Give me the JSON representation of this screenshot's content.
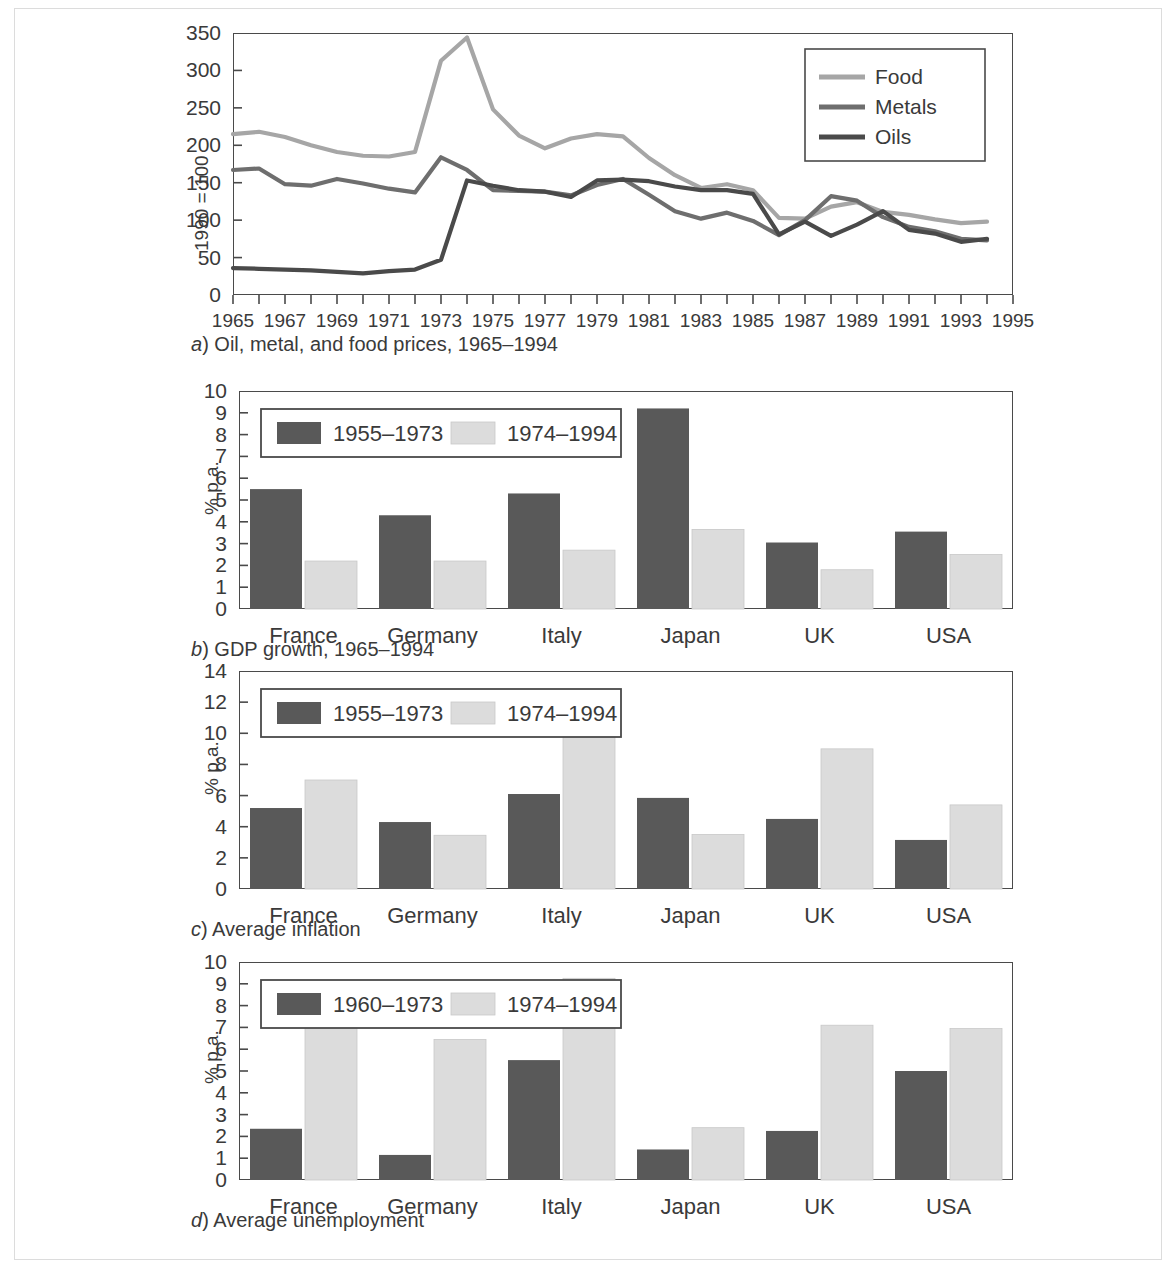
{
  "figure": {
    "panels": [
      {
        "id": "a",
        "caption_letter": "a",
        "caption_text": ") Oil, metal, and food prices, 1965–1994"
      },
      {
        "id": "b",
        "caption_letter": "b",
        "caption_text": ") GDP growth, 1965–1994"
      },
      {
        "id": "c",
        "caption_letter": "c",
        "caption_text": ") Average inflation"
      },
      {
        "id": "d",
        "caption_letter": "d",
        "caption_text": ") Average unemployment"
      }
    ]
  },
  "colors": {
    "food": "#a6a6a6",
    "metals": "#6e6e6e",
    "oils": "#4a4a4a",
    "bar_dark": "#595959",
    "bar_light": "#dcdcdc",
    "axis": "#4a4a4a",
    "text": "#3a3a3a",
    "frame": "#dcdcdc"
  },
  "chart_data": [
    {
      "type": "line",
      "panel": "a",
      "title": "(a) Oil, metal, and food prices, 1965–1994",
      "xlabel": "",
      "ylabel": "1990 = 100",
      "xlim": [
        1965,
        1995
      ],
      "ylim": [
        0,
        350
      ],
      "yticks": [
        0,
        50,
        100,
        150,
        200,
        250,
        300,
        350
      ],
      "xticks": [
        1965,
        1967,
        1969,
        1971,
        1973,
        1975,
        1977,
        1979,
        1981,
        1983,
        1985,
        1987,
        1989,
        1991,
        1993,
        1995
      ],
      "xtick_minor_step": 1,
      "grid": false,
      "legend_position": "top-right",
      "x": [
        1965,
        1966,
        1967,
        1968,
        1969,
        1970,
        1971,
        1972,
        1973,
        1974,
        1975,
        1976,
        1977,
        1978,
        1979,
        1980,
        1981,
        1982,
        1983,
        1984,
        1985,
        1986,
        1987,
        1988,
        1989,
        1990,
        1991,
        1992,
        1993,
        1994
      ],
      "series": [
        {
          "name": "Food",
          "color": "#a6a6a6",
          "values": [
            215,
            218,
            211,
            200,
            191,
            186,
            185,
            191,
            313,
            344,
            248,
            213,
            196,
            209,
            215,
            212,
            183,
            160,
            143,
            148,
            140,
            103,
            102,
            118,
            124,
            111,
            107,
            101,
            96,
            98
          ]
        },
        {
          "name": "Metals",
          "color": "#6e6e6e",
          "values": [
            167,
            169,
            148,
            146,
            155,
            149,
            142,
            137,
            184,
            167,
            140,
            139,
            138,
            133,
            147,
            155,
            134,
            112,
            102,
            110,
            99,
            80,
            100,
            132,
            126,
            104,
            91,
            85,
            75,
            73
          ]
        },
        {
          "name": "Oils",
          "color": "#4a4a4a",
          "values": [
            36,
            35,
            34,
            33,
            31,
            29,
            32,
            34,
            47,
            153,
            146,
            140,
            138,
            131,
            153,
            154,
            152,
            145,
            140,
            140,
            135,
            81,
            98,
            79,
            94,
            112,
            87,
            82,
            71,
            75
          ]
        }
      ]
    },
    {
      "type": "bar",
      "panel": "b",
      "title": "(b) GDP growth, 1965–1994",
      "xlabel": "",
      "ylabel": "% p.a.",
      "ylim": [
        0,
        10
      ],
      "yticks": [
        0,
        1,
        2,
        3,
        4,
        5,
        6,
        7,
        8,
        9,
        10
      ],
      "grid": false,
      "legend_position": "top-left",
      "categories": [
        "France",
        "Germany",
        "Italy",
        "Japan",
        "UK",
        "USA"
      ],
      "series": [
        {
          "name": "1955–1973",
          "color": "#595959",
          "values": [
            5.5,
            4.3,
            5.3,
            9.2,
            3.05,
            3.55
          ]
        },
        {
          "name": "1974–1994",
          "color": "#dcdcdc",
          "values": [
            2.2,
            2.2,
            2.7,
            3.65,
            1.8,
            2.5
          ]
        }
      ]
    },
    {
      "type": "bar",
      "panel": "c",
      "title": "(c) Average inflation",
      "xlabel": "",
      "ylabel": "% p.a.",
      "ylim": [
        0,
        14
      ],
      "yticks": [
        0,
        2,
        4,
        6,
        8,
        10,
        12,
        14
      ],
      "grid": false,
      "legend_position": "top-left",
      "categories": [
        "France",
        "Germany",
        "Italy",
        "Japan",
        "UK",
        "USA"
      ],
      "series": [
        {
          "name": "1955–1973",
          "color": "#595959",
          "values": [
            5.2,
            4.3,
            6.1,
            5.85,
            4.5,
            3.15
          ]
        },
        {
          "name": "1974–1994",
          "color": "#dcdcdc",
          "values": [
            7.0,
            3.45,
            12.55,
            3.5,
            9.0,
            5.4
          ]
        }
      ]
    },
    {
      "type": "bar",
      "panel": "d",
      "title": "(d) Average unemployment",
      "xlabel": "",
      "ylabel": "% p.a.",
      "ylim": [
        0,
        10
      ],
      "yticks": [
        0,
        1,
        2,
        3,
        4,
        5,
        6,
        7,
        8,
        9,
        10
      ],
      "grid": false,
      "legend_position": "top-left",
      "categories": [
        "France",
        "Germany",
        "Italy",
        "Japan",
        "UK",
        "USA"
      ],
      "series": [
        {
          "name": "1960–1973",
          "color": "#595959",
          "values": [
            2.35,
            1.15,
            5.5,
            1.4,
            2.25,
            5.0
          ]
        },
        {
          "name": "1974–1994",
          "color": "#dcdcdc",
          "values": [
            7.75,
            6.45,
            9.25,
            2.4,
            7.1,
            6.95
          ]
        }
      ]
    }
  ]
}
